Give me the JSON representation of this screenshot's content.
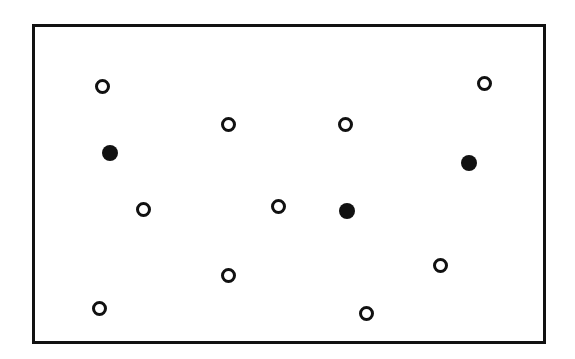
{
  "diagram": {
    "frame": {
      "x": 32,
      "y": 24,
      "width": 514,
      "height": 320,
      "border_color": "#111111"
    },
    "colors": {
      "stroke": "#111111",
      "background": "#ffffff"
    },
    "points": [
      {
        "type": "open",
        "x": 102,
        "y": 86
      },
      {
        "type": "open",
        "x": 484,
        "y": 83
      },
      {
        "type": "open",
        "x": 228,
        "y": 124
      },
      {
        "type": "open",
        "x": 345,
        "y": 124
      },
      {
        "type": "filled",
        "x": 110,
        "y": 153
      },
      {
        "type": "filled",
        "x": 469,
        "y": 163
      },
      {
        "type": "open",
        "x": 143,
        "y": 209
      },
      {
        "type": "open",
        "x": 278,
        "y": 206
      },
      {
        "type": "filled",
        "x": 347,
        "y": 211
      },
      {
        "type": "open",
        "x": 440,
        "y": 265
      },
      {
        "type": "open",
        "x": 228,
        "y": 275
      },
      {
        "type": "open",
        "x": 99,
        "y": 308
      },
      {
        "type": "open",
        "x": 366,
        "y": 313
      }
    ],
    "counts": {
      "open": 10,
      "filled": 3
    }
  }
}
